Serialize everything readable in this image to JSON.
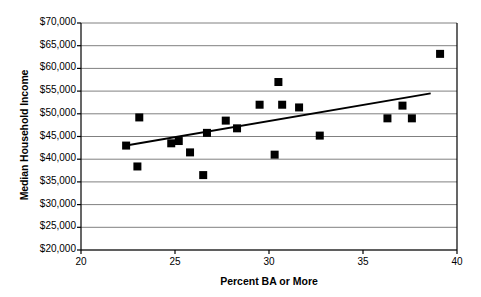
{
  "chart_data": {
    "type": "scatter",
    "title": "",
    "xlabel": "Percent BA or More",
    "ylabel": "Median Household Income",
    "xlim": [
      20,
      40
    ],
    "ylim": [
      20000,
      70000
    ],
    "xticks": [
      20,
      25,
      30,
      35,
      40
    ],
    "xtick_labels": [
      "20",
      "25",
      "30",
      "35",
      "40"
    ],
    "yticks": [
      20000,
      25000,
      30000,
      35000,
      40000,
      45000,
      50000,
      55000,
      60000,
      65000,
      70000
    ],
    "ytick_labels": [
      "$20,000",
      "$25,000",
      "$30,000",
      "$35,000",
      "$40,000",
      "$45,000",
      "$50,000",
      "$55,000",
      "$60,000",
      "$65,000",
      "$70,000"
    ],
    "grid": "horizontal",
    "legend": "none",
    "marker": "square",
    "marker_color": "#000000",
    "points": [
      {
        "x": 22.4,
        "y": 43000
      },
      {
        "x": 23.1,
        "y": 49200
      },
      {
        "x": 23.0,
        "y": 38400
      },
      {
        "x": 24.8,
        "y": 43500
      },
      {
        "x": 25.2,
        "y": 44000
      },
      {
        "x": 25.8,
        "y": 41500
      },
      {
        "x": 26.5,
        "y": 36500
      },
      {
        "x": 26.7,
        "y": 45800
      },
      {
        "x": 27.7,
        "y": 48500
      },
      {
        "x": 28.3,
        "y": 46800
      },
      {
        "x": 29.5,
        "y": 52000
      },
      {
        "x": 30.3,
        "y": 41000
      },
      {
        "x": 30.5,
        "y": 57000
      },
      {
        "x": 30.7,
        "y": 52000
      },
      {
        "x": 31.6,
        "y": 51400
      },
      {
        "x": 32.7,
        "y": 45200
      },
      {
        "x": 36.3,
        "y": 49000
      },
      {
        "x": 37.1,
        "y": 51800
      },
      {
        "x": 37.6,
        "y": 49000
      },
      {
        "x": 39.1,
        "y": 63200
      }
    ],
    "trendline": {
      "type": "linear",
      "x0": 22.4,
      "y0": 43000,
      "x1": 38.6,
      "y1": 54500,
      "color": "#000000"
    },
    "colors": {
      "axis": "#000000",
      "grid": "#808080",
      "plot_background": "#ffffff",
      "text": "#000000"
    }
  }
}
